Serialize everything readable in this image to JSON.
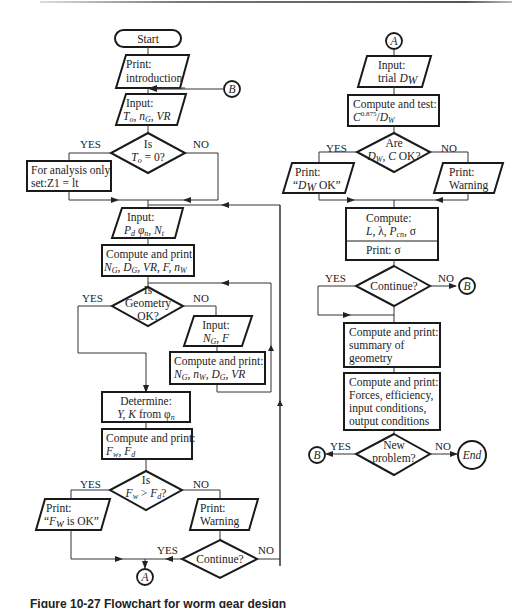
{
  "figure": {
    "caption": "Figure 10-27  Flowchart for worm gear design",
    "left_column": {
      "start": "Start",
      "print_intro": [
        "Print:",
        "introduction"
      ],
      "connector_B_in": "B",
      "input_1": [
        "Input:",
        "To, nG, VR"
      ],
      "decision_T0": [
        "Is",
        "To = 0?"
      ],
      "yes_1": "YES",
      "no_1": "NO",
      "analysis_box": [
        "For analysis only,",
        "set:Z1 = lt"
      ],
      "input_2": [
        "Input:",
        "Pd φn, Nt"
      ],
      "compute_1": [
        "Compute and print:",
        "NG, DG, VR, F, nW"
      ],
      "decision_geometry": [
        "Is",
        "Geometry",
        "OK?"
      ],
      "yes_2": "YES",
      "no_2": "NO",
      "input_3": [
        "Input:",
        "NG, F"
      ],
      "compute_2": [
        "Compute and print:",
        "NG, nW, DG, VR"
      ],
      "determine": [
        "Determine:",
        "Y, K from φn"
      ],
      "compute_3": [
        "Compute and print:",
        "Fw, Fd"
      ],
      "decision_force": [
        "Is",
        "Fw > Fd?"
      ],
      "yes_3": "YES",
      "no_3": "NO",
      "print_ok": [
        "Print:",
        "“Fw is OK”"
      ],
      "print_warning": [
        "Print:",
        "Warning"
      ],
      "decision_continue": "Continue?",
      "yes_4": "YES",
      "no_4": "NO",
      "connector_A_out": "A"
    },
    "right_column": {
      "connector_A_in": "A",
      "input_trial": [
        "Input:",
        "trial DW"
      ],
      "compute_test": [
        "Compute and test:",
        "C0.875/DW"
      ],
      "decision_dw": [
        "Are",
        "DW, C OK?"
      ],
      "yes_1": "YES",
      "no_1": "NO",
      "print_dw_ok": [
        "Print:",
        "“DW OK”"
      ],
      "print_warning": [
        "Print:",
        "Warning"
      ],
      "compute_stress": [
        "Compute:",
        "L, λ, Pcn, σ"
      ],
      "print_sigma": "Print: σ",
      "decision_continue": "Continue?",
      "yes_2": "YES",
      "no_2": "NO",
      "connector_B_out_1": "B",
      "summary": [
        "Compute and print:",
        "summary of",
        "geometry"
      ],
      "forces": [
        "Compute and print:",
        "Forces, efficiency,",
        "input conditions,",
        "output conditions"
      ],
      "decision_new": [
        "New",
        "problem?"
      ],
      "yes_3": "YES",
      "no_3": "NO",
      "connector_B_out_2": "B",
      "end": "End"
    }
  }
}
